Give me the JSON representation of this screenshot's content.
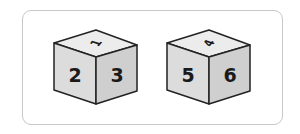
{
  "figure": {
    "colors": {
      "card_border": "#c8c8c8",
      "edge": "#222222",
      "top_face": "#ececec",
      "left_face": "#dcdcdc",
      "right_face": "#cfcfcf",
      "numeral": "#1a1a1a"
    },
    "dice": [
      {
        "top": "1",
        "left": "2",
        "right": "3"
      },
      {
        "top": "4",
        "left": "5",
        "right": "6"
      }
    ]
  }
}
